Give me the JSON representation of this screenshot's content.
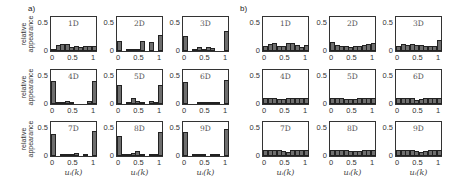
{
  "chart_data": [
    {
      "id": "a",
      "type": "bar",
      "panel_label": "a)",
      "ylabel": "relative appearance",
      "xlabel": "u_i(k)",
      "xlabel_display": "uᵢ(k)",
      "ylim": [
        0,
        0.6
      ],
      "yticks": [
        "0",
        "0.5"
      ],
      "xticks": [
        "0",
        "0.5",
        "1"
      ],
      "grid": false,
      "bin_centers": [
        0.05,
        0.15,
        0.25,
        0.35,
        0.45,
        0.55,
        0.65,
        0.75,
        0.85,
        0.95
      ],
      "subplots": [
        {
          "title": "1D",
          "values": [
            0.03,
            0.1,
            0.13,
            0.13,
            0.07,
            0.09,
            0.07,
            0.09,
            0.09,
            0.09
          ]
        },
        {
          "title": "2D",
          "values": [
            0.18,
            0.0,
            0.02,
            0.04,
            0.04,
            0.17,
            0.0,
            0.16,
            0.0,
            0.29
          ]
        },
        {
          "title": "3D",
          "values": [
            0.26,
            0.0,
            0.03,
            0.07,
            0.04,
            0.07,
            0.06,
            0.0,
            0.0,
            0.36
          ]
        },
        {
          "title": "4D",
          "values": [
            0.41,
            0.02,
            0.02,
            0.06,
            0.02,
            0.0,
            0.0,
            0.0,
            0.05,
            0.41
          ]
        },
        {
          "title": "5D",
          "values": [
            0.34,
            0.0,
            0.02,
            0.1,
            0.06,
            0.03,
            0.0,
            0.06,
            0.03,
            0.34
          ]
        },
        {
          "title": "6D",
          "values": [
            0.39,
            0.0,
            0.0,
            0.02,
            0.02,
            0.01,
            0.02,
            0.02,
            0.0,
            0.43
          ]
        },
        {
          "title": "7D",
          "values": [
            0.38,
            0.0,
            0.02,
            0.04,
            0.04,
            0.06,
            0.0,
            0.01,
            0.0,
            0.44
          ]
        },
        {
          "title": "8D",
          "values": [
            0.36,
            0.01,
            0.02,
            0.06,
            0.08,
            0.01,
            0.0,
            0.01,
            0.01,
            0.42
          ]
        },
        {
          "title": "9D",
          "values": [
            0.43,
            0.0,
            0.02,
            0.02,
            0.02,
            0.0,
            0.01,
            0.01,
            0.0,
            0.47
          ]
        }
      ]
    },
    {
      "id": "b",
      "type": "bar",
      "panel_label": "b)",
      "ylabel": "",
      "xlabel": "u_i(k)",
      "xlabel_display": "uᵢ(k)",
      "ylim": [
        0,
        0.6
      ],
      "yticks": [
        "0",
        "0.5"
      ],
      "xticks": [
        "0",
        "0.5",
        "1"
      ],
      "grid": false,
      "bin_centers": [
        0.05,
        0.15,
        0.25,
        0.35,
        0.45,
        0.55,
        0.65,
        0.75,
        0.85,
        0.95
      ],
      "subplots": [
        {
          "title": "1D",
          "values": [
            0.09,
            0.12,
            0.14,
            0.09,
            0.09,
            0.14,
            0.14,
            0.11,
            0.07,
            0.11
          ]
        },
        {
          "title": "2D",
          "values": [
            0.16,
            0.1,
            0.08,
            0.08,
            0.07,
            0.08,
            0.09,
            0.11,
            0.12,
            0.15
          ]
        },
        {
          "title": "3D",
          "values": [
            0.09,
            0.12,
            0.1,
            0.12,
            0.1,
            0.11,
            0.09,
            0.08,
            0.09,
            0.2
          ]
        },
        {
          "title": "4D",
          "values": [
            0.1,
            0.1,
            0.1,
            0.09,
            0.08,
            0.1,
            0.1,
            0.1,
            0.1,
            0.1
          ]
        },
        {
          "title": "5D",
          "values": [
            0.1,
            0.1,
            0.1,
            0.09,
            0.09,
            0.08,
            0.1,
            0.1,
            0.1,
            0.1
          ]
        },
        {
          "title": "6D",
          "values": [
            0.11,
            0.11,
            0.1,
            0.1,
            0.07,
            0.09,
            0.1,
            0.1,
            0.1,
            0.1
          ]
        },
        {
          "title": "7D",
          "values": [
            0.1,
            0.1,
            0.1,
            0.1,
            0.09,
            0.07,
            0.1,
            0.1,
            0.1,
            0.1
          ]
        },
        {
          "title": "8D",
          "values": [
            0.1,
            0.1,
            0.1,
            0.1,
            0.09,
            0.08,
            0.09,
            0.1,
            0.1,
            0.1
          ]
        },
        {
          "title": "9D",
          "values": [
            0.1,
            0.1,
            0.1,
            0.1,
            0.09,
            0.07,
            0.08,
            0.1,
            0.1,
            0.1
          ]
        }
      ]
    }
  ],
  "layout": {
    "a": {
      "cols_x": [
        50,
        116,
        182
      ],
      "rows_y": [
        16,
        69,
        121
      ],
      "ax_w": 47,
      "ax_h": 36,
      "label_x": 28,
      "label_y": 4
    },
    "b": {
      "cols_x": [
        262,
        329,
        395
      ],
      "rows_y": [
        16,
        69,
        121
      ],
      "ax_w": 47,
      "ax_h": 36,
      "label_x": 240,
      "label_y": 4
    }
  }
}
